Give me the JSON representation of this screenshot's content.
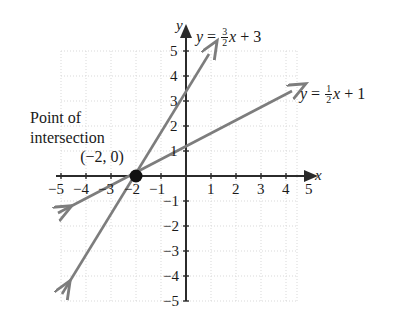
{
  "chart_data": {
    "type": "line",
    "title": "",
    "xlabel": "x",
    "ylabel": "y",
    "xlim": [
      -5,
      4.4
    ],
    "ylim": [
      -5,
      5
    ],
    "grid": true,
    "grid_spacing": 1,
    "legend_position": "inline-right-of-line",
    "x_ticks": [
      -5,
      -4,
      -3,
      -2,
      -1,
      1,
      2,
      3,
      4,
      5
    ],
    "y_ticks": [
      5,
      4,
      3,
      2,
      1,
      -1,
      -2,
      -3,
      -4,
      -5
    ],
    "x_tick_labels": [
      "-5",
      "-4",
      "-3",
      "-2",
      "-1",
      "1",
      "2",
      "3",
      "4",
      "5"
    ],
    "y_tick_labels": [
      "5",
      "4",
      "3",
      "2",
      "1",
      "-1",
      "-2",
      "-3",
      "-4",
      "-5"
    ],
    "series": [
      {
        "name": "y = 3/2 x + 3",
        "slope": 1.5,
        "intercept": 3,
        "label_html": "<i>y</i> = <span class=\"frac\"><span class=\"num\">3</span><span class=\"den\">2</span></span><i>x</i> + 3",
        "color": "#7d7d7d",
        "arrows": "both",
        "points": [
          [
            -2,
            0
          ],
          [
            0,
            3
          ],
          [
            1.3,
            5
          ]
        ]
      },
      {
        "name": "y = 1/2 x + 1",
        "slope": 0.5,
        "intercept": 1,
        "label_html": "<i>y</i> = <span class=\"frac\"><span class=\"num\">1</span><span class=\"den\">2</span></span><i>x</i> + 1",
        "color": "#7d7d7d",
        "arrows": "both",
        "points": [
          [
            -2,
            0
          ],
          [
            0,
            1
          ],
          [
            4.2,
            3.1
          ]
        ]
      }
    ],
    "annotations": [
      {
        "name": "point-of-intersection",
        "lines": [
          "Point of",
          "intersection",
          "(−2, 0)"
        ],
        "point": [
          -2,
          0
        ],
        "marker": "filled-circle"
      }
    ]
  },
  "labels": {
    "equation_1": "y = 3/2 x + 3",
    "equation_2": "y = 1/2 x + 1",
    "axis_x": "x",
    "axis_y": "y",
    "annotation_line_1": "Point of",
    "annotation_line_2": "intersection",
    "annotation_line_3": "(−2, 0)",
    "ticks": {
      "xm5": "−5",
      "xm4": "−4",
      "xm3": "−3",
      "xm2": "−2",
      "xm1": "−1",
      "x1": "1",
      "x2": "2",
      "x3": "3",
      "x4": "4",
      "x5": "5",
      "y5": "5",
      "y4": "4",
      "y3": "3",
      "y2": "2",
      "y1": "1",
      "ym1": "−1",
      "ym2": "−2",
      "ym3": "−3",
      "ym4": "−4",
      "ym5": "−5"
    }
  },
  "colors": {
    "line": "#7d7d7d",
    "axis": "#2b2b2b",
    "grid": "#d9d9d9",
    "text": "#1a1a1a",
    "background": "#ffffff",
    "marker": "#111111"
  }
}
